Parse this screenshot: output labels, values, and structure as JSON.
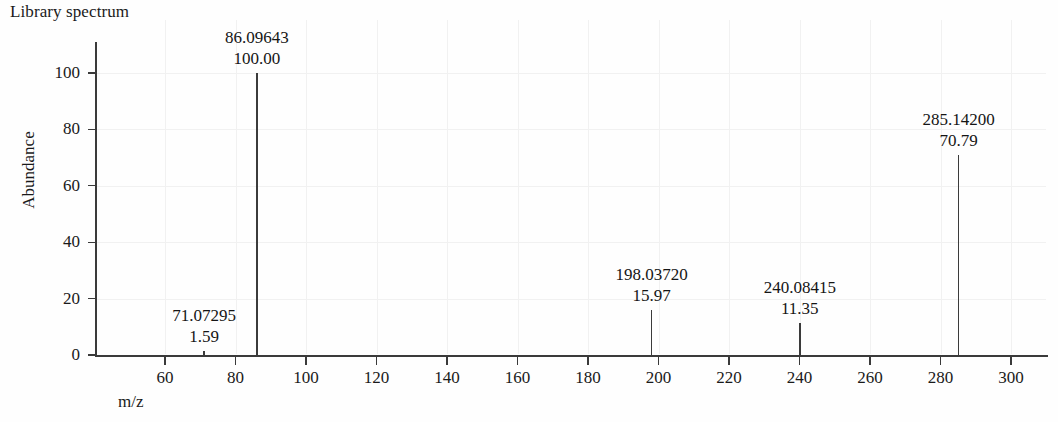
{
  "chart_data": {
    "type": "bar",
    "title": "Library spectrum",
    "xlabel": "m/z",
    "ylabel": "Abundance",
    "xlim": [
      50,
      312
    ],
    "ylim": [
      0,
      100
    ],
    "grid": true,
    "legend": null,
    "x_ticks": [
      60,
      80,
      100,
      120,
      140,
      160,
      180,
      200,
      220,
      240,
      260,
      280,
      300
    ],
    "y_ticks": [
      0,
      20,
      40,
      60,
      80,
      100
    ],
    "x": [
      71.07295,
      86.09643,
      198.0372,
      240.08415,
      285.142
    ],
    "values": [
      1.59,
      100.0,
      15.97,
      11.35,
      70.79
    ],
    "annotations": [
      {
        "mz": "71.07295",
        "abundance": "1.59",
        "x": 71.07295,
        "y": 1.59
      },
      {
        "mz": "86.09643",
        "abundance": "100.00",
        "x": 86.09643,
        "y": 100.0
      },
      {
        "mz": "198.03720",
        "abundance": "15.97",
        "x": 198.0372,
        "y": 15.97
      },
      {
        "mz": "240.08415",
        "abundance": "11.35",
        "x": 240.08415,
        "y": 11.35
      },
      {
        "mz": "285.14200",
        "abundance": "70.79",
        "x": 285.142,
        "y": 70.79
      }
    ],
    "colors": {
      "peak": "#3b3b3b",
      "axis": "#3a3a3a",
      "grid": "#f1f1f1",
      "background": "#fefefe",
      "text": "#1a1a1a"
    }
  }
}
